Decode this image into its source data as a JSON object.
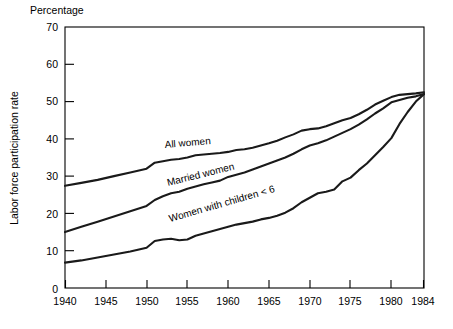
{
  "chart_data": {
    "type": "line",
    "title": "",
    "ylabel": "Labor force participation rate",
    "yaxis_unit_label": "Percentage",
    "xlabel": "",
    "ylim": [
      0,
      70
    ],
    "xlim": [
      1940,
      1984
    ],
    "grid": false,
    "legend_position": "inline-labels",
    "y_ticks": [
      0,
      10,
      20,
      30,
      40,
      50,
      60,
      70
    ],
    "y_tick_labels": [
      "0",
      "10",
      "20",
      "30",
      "40",
      "50",
      "60",
      "70"
    ],
    "x_ticks": [
      1940,
      1945,
      1950,
      1955,
      1960,
      1965,
      1970,
      1975,
      1980,
      1984
    ],
    "x_tick_labels": [
      "1940",
      "1945",
      "1950",
      "1955",
      "1960",
      "1965",
      "1970",
      "1975",
      "1980",
      "1984"
    ],
    "series": [
      {
        "name": "All women",
        "label": "All women",
        "color": "#1a1a1a",
        "x": [
          1940,
          1942,
          1944,
          1946,
          1948,
          1950,
          1951,
          1952,
          1953,
          1954,
          1955,
          1956,
          1957,
          1958,
          1959,
          1960,
          1961,
          1962,
          1963,
          1964,
          1965,
          1966,
          1967,
          1968,
          1969,
          1970,
          1971,
          1972,
          1973,
          1974,
          1975,
          1976,
          1977,
          1978,
          1979,
          1980,
          1981,
          1982,
          1983,
          1984
        ],
        "y": [
          27.4,
          28.2,
          29.0,
          30.0,
          31.0,
          32.0,
          33.6,
          34.0,
          34.4,
          34.6,
          35.0,
          35.6,
          35.8,
          36.0,
          36.2,
          36.5,
          37.0,
          37.2,
          37.6,
          38.2,
          38.8,
          39.5,
          40.4,
          41.2,
          42.2,
          42.6,
          42.8,
          43.4,
          44.2,
          45.0,
          45.6,
          46.6,
          47.8,
          49.2,
          50.2,
          51.2,
          51.8,
          52.0,
          52.2,
          52.5
        ],
        "end_value": 52.5
      },
      {
        "name": "Married women",
        "label": "Married women",
        "color": "#1a1a1a",
        "x": [
          1940,
          1942,
          1944,
          1946,
          1948,
          1950,
          1951,
          1952,
          1953,
          1954,
          1955,
          1956,
          1957,
          1958,
          1959,
          1960,
          1961,
          1962,
          1963,
          1964,
          1965,
          1966,
          1967,
          1968,
          1969,
          1970,
          1971,
          1972,
          1973,
          1974,
          1975,
          1976,
          1977,
          1978,
          1979,
          1980,
          1981,
          1982,
          1983,
          1984
        ],
        "y": [
          15.0,
          16.4,
          17.8,
          19.2,
          20.6,
          22.0,
          23.6,
          24.6,
          25.4,
          25.8,
          26.6,
          27.2,
          27.8,
          28.3,
          28.8,
          29.8,
          30.4,
          31.0,
          31.8,
          32.6,
          33.4,
          34.2,
          35.0,
          36.0,
          37.2,
          38.2,
          38.8,
          39.6,
          40.6,
          41.6,
          42.6,
          43.8,
          45.2,
          46.8,
          48.2,
          49.8,
          50.4,
          51.0,
          51.4,
          52.0
        ],
        "end_value": 52.0
      },
      {
        "name": "Women with children < 6",
        "label": "Women with children < 6",
        "color": "#1a1a1a",
        "x": [
          1940,
          1942,
          1944,
          1946,
          1948,
          1950,
          1951,
          1952,
          1953,
          1954,
          1955,
          1956,
          1957,
          1958,
          1959,
          1960,
          1961,
          1962,
          1963,
          1964,
          1965,
          1966,
          1967,
          1968,
          1969,
          1970,
          1971,
          1972,
          1973,
          1974,
          1975,
          1976,
          1977,
          1978,
          1979,
          1980,
          1981,
          1982,
          1983,
          1984
        ],
        "y": [
          6.8,
          7.4,
          8.2,
          9.0,
          9.8,
          10.8,
          12.6,
          13.0,
          13.2,
          12.8,
          13.0,
          14.0,
          14.6,
          15.2,
          15.8,
          16.4,
          17.0,
          17.4,
          17.8,
          18.4,
          18.8,
          19.4,
          20.2,
          21.4,
          23.0,
          24.2,
          25.4,
          25.8,
          26.4,
          28.6,
          29.6,
          31.6,
          33.4,
          35.6,
          37.8,
          40.2,
          44.0,
          47.2,
          50.0,
          52.0
        ],
        "end_value": 52.0
      }
    ]
  }
}
